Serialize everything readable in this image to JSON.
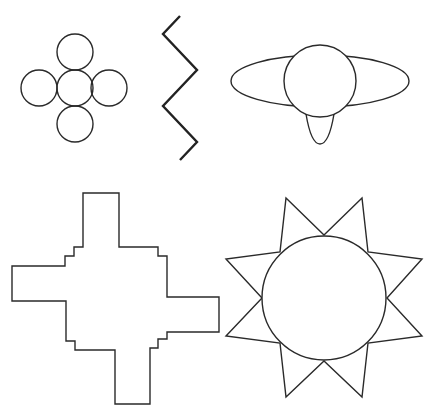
{
  "figure": {
    "stroke_color": "#2a2a2a",
    "background": "#ffffff"
  },
  "shapes": {
    "circle_cluster": {
      "label": "five-circle cross",
      "circles": [
        {
          "cx": 75,
          "cy": 88,
          "r": 18
        },
        {
          "cx": 75,
          "cy": 52,
          "r": 18
        },
        {
          "cx": 75,
          "cy": 124,
          "r": 18
        },
        {
          "cx": 39,
          "cy": 88,
          "r": 18
        },
        {
          "cx": 109,
          "cy": 88,
          "r": 18
        }
      ]
    },
    "zigzag": {
      "label": "zigzag line",
      "points": "180,16 163,34 197,70 163,106 197,142 180,160"
    },
    "ellipse_figure": {
      "label": "ellipse with circle and drop",
      "ellipse": {
        "cx": 320,
        "cy": 81,
        "rx": 89,
        "ry": 26
      },
      "circle": {
        "cx": 320,
        "cy": 81,
        "r": 36
      },
      "drop_path": "M306,114 C309,132 314,144 320,144 C326,144 331,132 334,114"
    },
    "stepped_cross": {
      "label": "stepped cross polygon",
      "points": "83,193 119,193 119,247 158,247 158,256 167,256 167,297 219,297 219,332 167,332 167,339 158,339 158,348 150,348 150,404 115,404 115,350 75,350 75,341 66,341 66,301 12,301 12,266 65,266 65,256 74,256 74,247 83,247"
    },
    "sun": {
      "label": "eight-point star with circle",
      "circle": {
        "cx": 324,
        "cy": 298,
        "r": 62
      },
      "star_points": "324,235 362,198 368,252 422,259 387,298 422,336 368,343 362,397 324,361 286,397 280,343 226,336 262,298 226,259 280,252 286,198"
    }
  }
}
